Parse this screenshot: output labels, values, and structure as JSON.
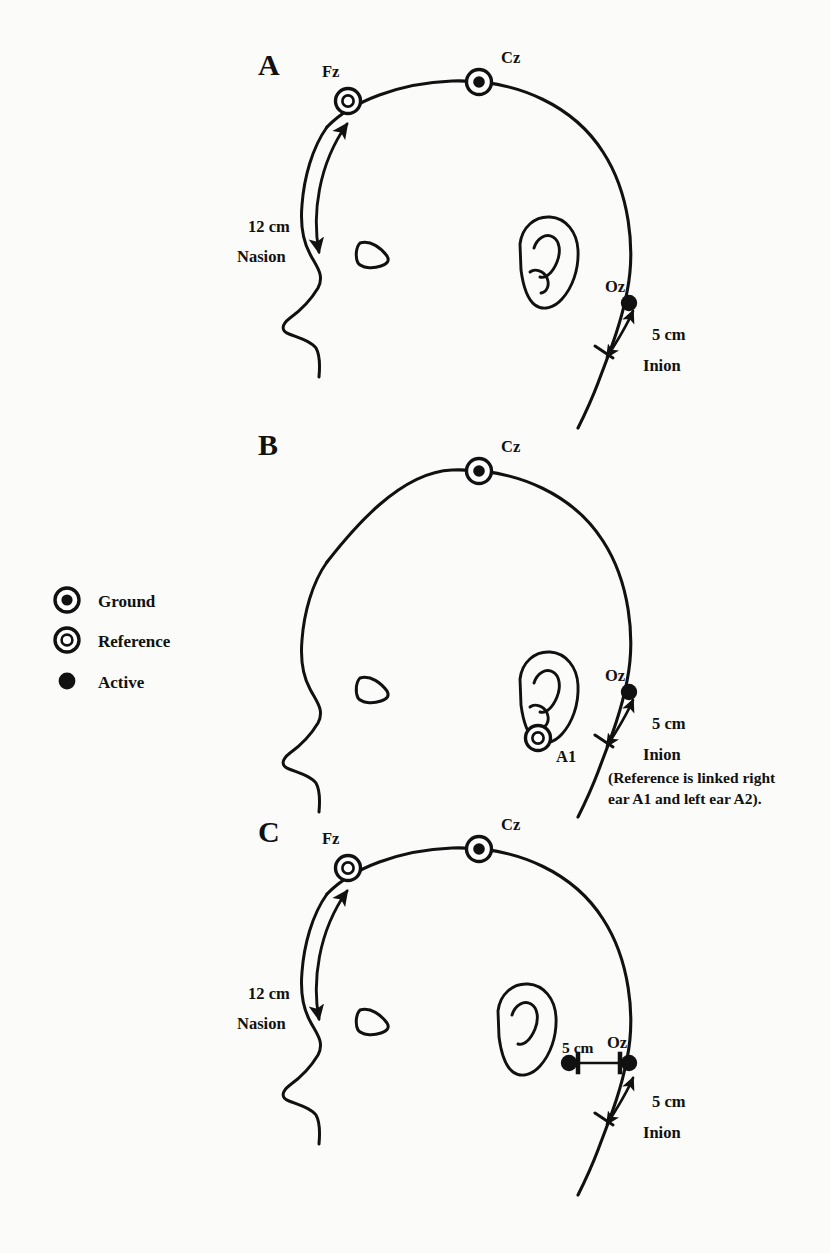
{
  "figure": {
    "background_color": "#fbfbf9",
    "ink_color": "#111111"
  },
  "legend": {
    "items": [
      {
        "symbol": "ground-symbol",
        "label": "Ground"
      },
      {
        "symbol": "reference-symbol",
        "label": "Reference"
      },
      {
        "symbol": "active-symbol",
        "label": "Active"
      }
    ]
  },
  "panels": [
    {
      "letter": "A",
      "electrodes": [
        {
          "name": "Fz",
          "type": "reference"
        },
        {
          "name": "Cz",
          "type": "ground"
        },
        {
          "name": "Oz",
          "type": "active"
        }
      ],
      "landmarks": [
        {
          "name": "Nasion"
        },
        {
          "name": "Inion"
        }
      ],
      "measurements": [
        {
          "value": "12 cm",
          "from": "Nasion",
          "to": "Fz"
        },
        {
          "value": "5 cm",
          "from": "Inion",
          "to": "Oz"
        }
      ],
      "note": ""
    },
    {
      "letter": "B",
      "electrodes": [
        {
          "name": "Cz",
          "type": "ground"
        },
        {
          "name": "A1",
          "type": "reference"
        },
        {
          "name": "Oz",
          "type": "active"
        }
      ],
      "landmarks": [
        {
          "name": "Inion"
        }
      ],
      "measurements": [
        {
          "value": "5 cm",
          "from": "Inion",
          "to": "Oz"
        }
      ],
      "note": "(Reference is linked right ear A1 and left ear A2)."
    },
    {
      "letter": "C",
      "electrodes": [
        {
          "name": "Fz",
          "type": "reference"
        },
        {
          "name": "Cz",
          "type": "ground"
        },
        {
          "name": "Oz",
          "type": "active"
        },
        {
          "name": "lateral",
          "type": "active"
        }
      ],
      "landmarks": [
        {
          "name": "Nasion"
        },
        {
          "name": "Inion"
        }
      ],
      "measurements": [
        {
          "value": "12 cm",
          "from": "Nasion",
          "to": "Fz"
        },
        {
          "value": "5 cm",
          "from": "lateral",
          "to": "Oz"
        },
        {
          "value": "5 cm",
          "from": "Inion",
          "to": "Oz"
        }
      ],
      "note": ""
    }
  ],
  "labels": {
    "panel_a_letter": "A",
    "panel_b_letter": "B",
    "panel_c_letter": "C",
    "fz": "Fz",
    "cz": "Cz",
    "oz": "Oz",
    "a1": "A1",
    "nasion": "Nasion",
    "inion": "Inion",
    "twelve_cm": "12 cm",
    "five_cm": "5 cm",
    "note_line1": "(Reference is linked right",
    "note_line2": "ear A1 and left ear A2)."
  }
}
